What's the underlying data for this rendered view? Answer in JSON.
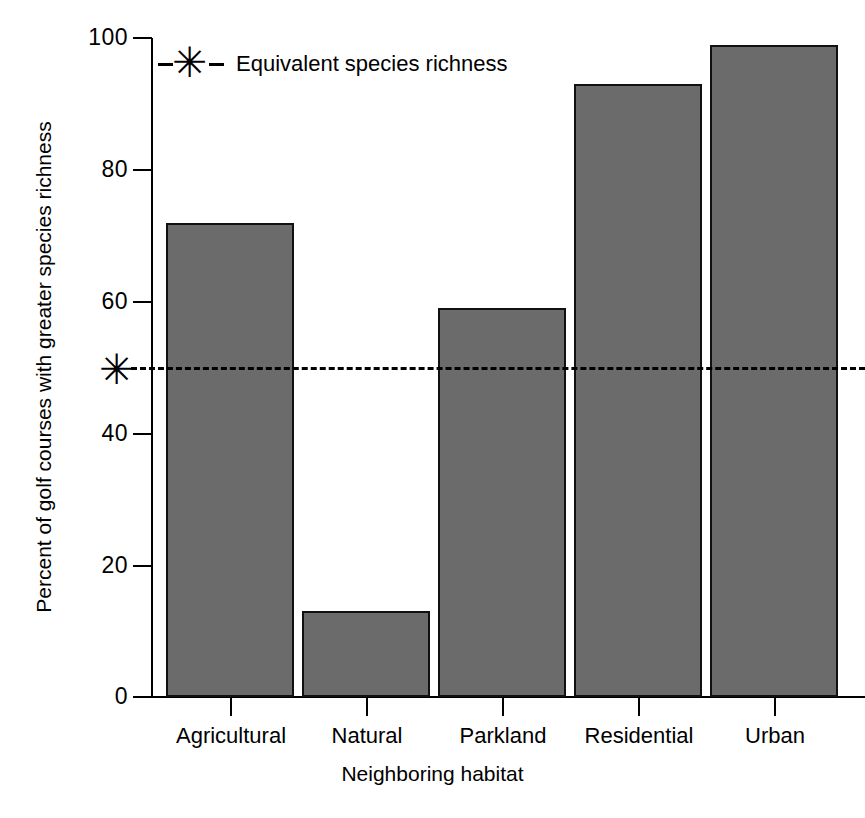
{
  "chart_data": {
    "type": "bar",
    "title": "",
    "xlabel": "Neighboring habitat",
    "ylabel": "Percent of golf courses with greater species richness",
    "categories": [
      "Agricultural",
      "Natural",
      "Parkland",
      "Residential",
      "Urban"
    ],
    "values": [
      72,
      13,
      59,
      93,
      99
    ],
    "ylim": [
      0,
      100
    ],
    "yticks": [
      0,
      20,
      40,
      60,
      80,
      100
    ],
    "ytick_labels": [
      "0",
      "20",
      "40",
      "60",
      "80",
      "100"
    ],
    "grid": false,
    "legend_position": "top-left",
    "legend": [
      {
        "label": "Equivalent species richness",
        "marker": "asterisk-dashed-line",
        "color": "#000000"
      }
    ],
    "annotations": [
      {
        "type": "reference-line",
        "orientation": "horizontal",
        "value": 50,
        "style": "dashed",
        "marker": "asterisk",
        "label": "Equivalent species richness"
      }
    ],
    "bar_color": "#6b6b6b",
    "bar_edge_color": "#111111",
    "axis_color": "#000000",
    "background_color": "#ffffff"
  },
  "axes": {
    "y_title": "Percent of golf courses with greater species richness",
    "x_title": "Neighboring habitat",
    "y_ticks": [
      {
        "label": "100",
        "value": 100
      },
      {
        "label": "80",
        "value": 80
      },
      {
        "label": "60",
        "value": 60
      },
      {
        "label": "40",
        "value": 40
      },
      {
        "label": "20",
        "value": 20
      },
      {
        "label": "0",
        "value": 0
      }
    ],
    "x_ticks": [
      {
        "label": "Agricultural"
      },
      {
        "label": "Natural"
      },
      {
        "label": "Parkland"
      },
      {
        "label": "Residential"
      },
      {
        "label": "Urban"
      }
    ]
  },
  "legend": {
    "entry_label": "Equivalent species richness",
    "marker_glyph": "✳"
  },
  "reference": {
    "asterisk_glyph": "✳"
  },
  "bars": [
    {
      "category": "Agricultural",
      "value": 72
    },
    {
      "category": "Natural",
      "value": 13
    },
    {
      "category": "Parkland",
      "value": 59
    },
    {
      "category": "Residential",
      "value": 93
    },
    {
      "category": "Urban",
      "value": 99
    }
  ]
}
